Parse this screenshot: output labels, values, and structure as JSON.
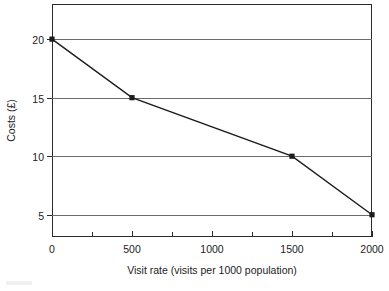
{
  "chart_data": {
    "type": "line",
    "title": "",
    "subtitle": "",
    "xlabel": "Visit rate (visits per 1000 population)",
    "ylabel": "Costs (£)",
    "x": [
      0,
      500,
      1500,
      2000
    ],
    "values": [
      20,
      15,
      10,
      5
    ],
    "series": [
      {
        "name": "Costs",
        "x": [
          0,
          500,
          1500,
          2000
        ],
        "values": [
          20,
          15,
          10,
          5
        ]
      }
    ],
    "points": [
      {
        "x": 0,
        "y": 20
      },
      {
        "x": 500,
        "y": 15
      },
      {
        "x": 1500,
        "y": 10
      },
      {
        "x": 2000,
        "y": 5
      }
    ],
    "xlim": [
      0,
      2000
    ],
    "ylim": [
      3.1,
      23.0
    ],
    "x_major_ticks": [
      0,
      500,
      1000,
      1500,
      2000
    ],
    "x_minor_ticks": [
      250,
      750,
      1250,
      1750
    ],
    "x_tick_labels": [
      "0",
      "500",
      "1000",
      "1500",
      "2000"
    ],
    "y_ticks": [
      5,
      10,
      15,
      20
    ],
    "y_tick_labels": [
      "5",
      "10",
      "15",
      "20"
    ],
    "grid": "horizontal",
    "legend": "none",
    "marker": "square",
    "colors": {
      "line": "#1c1c1c",
      "marker": "#1c1c1c",
      "grid": "#6b6b6b",
      "axis": "#2b2b2b",
      "background": "#ffffff",
      "text": "#1c1c1c"
    }
  },
  "axes": {
    "y_label": "Costs (£)",
    "x_label": "Visit rate (visits per 1000 population)",
    "y_tick_labels": [
      "20",
      "15",
      "10",
      "5"
    ],
    "x_tick_labels": [
      "0",
      "500",
      "1000",
      "1500",
      "2000"
    ]
  }
}
